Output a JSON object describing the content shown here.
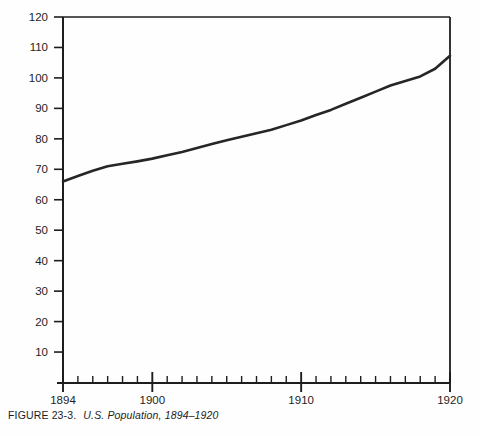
{
  "figure": {
    "caption_label": "FIGURE 23-3.",
    "caption_title": "U.S. Population, 1894–1920"
  },
  "chart_data": {
    "type": "line",
    "title": "U.S. Population, 1894–1920",
    "xlabel": "",
    "ylabel": "",
    "xlim": [
      1894,
      1920
    ],
    "ylim": [
      0,
      120
    ],
    "grid": false,
    "legend": null,
    "y_ticks": [
      10,
      20,
      30,
      40,
      50,
      60,
      70,
      80,
      90,
      100,
      110,
      120
    ],
    "y_tick_labels": [
      "10",
      "20",
      "30",
      "40",
      "50",
      "60",
      "70",
      "80",
      "90",
      "100",
      "110",
      "120"
    ],
    "x_ticks": [
      1894,
      1895,
      1896,
      1897,
      1898,
      1899,
      1900,
      1901,
      1902,
      1903,
      1904,
      1905,
      1906,
      1907,
      1908,
      1909,
      1910,
      1911,
      1912,
      1913,
      1914,
      1915,
      1916,
      1917,
      1918,
      1919,
      1920
    ],
    "x_tick_labels_shown": [
      "1894",
      "1900",
      "1910",
      "1920"
    ],
    "x_major_ticks": [
      1894,
      1900,
      1910,
      1920
    ],
    "line_color": "#262626",
    "line_width": 2.6,
    "axis_color": "#1d1d1d",
    "background": "#fefefe",
    "x": [
      1894,
      1895,
      1896,
      1897,
      1898,
      1899,
      1900,
      1901,
      1902,
      1903,
      1904,
      1905,
      1906,
      1907,
      1908,
      1909,
      1910,
      1911,
      1912,
      1913,
      1914,
      1915,
      1916,
      1917,
      1918,
      1919,
      1920
    ],
    "values": [
      66.0,
      67.8,
      69.5,
      71.0,
      71.8,
      72.6,
      73.5,
      74.6,
      75.7,
      77.0,
      78.3,
      79.5,
      80.7,
      81.8,
      83.0,
      84.5,
      86.0,
      87.8,
      89.5,
      91.5,
      93.5,
      95.5,
      97.5,
      99.0,
      100.5,
      103.0,
      107.3
    ],
    "units": "millions"
  }
}
